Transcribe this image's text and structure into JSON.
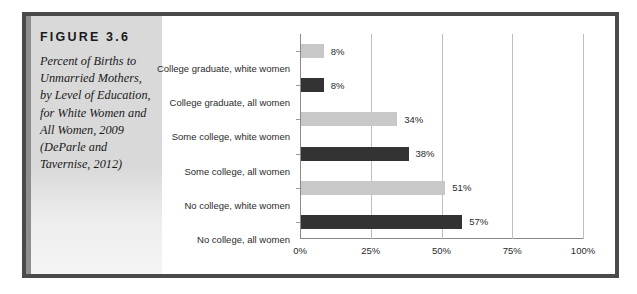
{
  "figure": {
    "number": "FIGURE 3.6",
    "caption": "Percent of Births to Unmarried Mothers, by Level of Education, for White Women and All Women, 2009 (DeParle and Tavernise, 2012)"
  },
  "colors": {
    "white_women_bar": "#c8c8c8",
    "all_women_bar": "#333333",
    "frame": "#4a4a4a",
    "panel": "#d9d9d9",
    "gridline": "#bdbdbd"
  },
  "chart_data": {
    "type": "bar",
    "orientation": "horizontal",
    "title": "",
    "xlabel": "",
    "ylabel": "",
    "xlim": [
      0,
      100
    ],
    "grid": true,
    "legend": "none",
    "tick_labels": [
      "0%",
      "25%",
      "50%",
      "75%",
      "100%"
    ],
    "ticks": [
      0,
      25,
      50,
      75,
      100
    ],
    "categories": [
      "College graduate, white women",
      "College graduate, all women",
      "Some college, white women",
      "Some college, all women",
      "No college, white women",
      "No college, all women"
    ],
    "values": [
      8,
      8,
      34,
      38,
      51,
      57
    ],
    "value_labels": [
      "8%",
      "8%",
      "34%",
      "38%",
      "51%",
      "57%"
    ],
    "group_of": [
      "white women",
      "all women",
      "white women",
      "all women",
      "white women",
      "all women"
    ],
    "bar_colors": [
      "#c8c8c8",
      "#333333",
      "#c8c8c8",
      "#333333",
      "#c8c8c8",
      "#333333"
    ]
  }
}
